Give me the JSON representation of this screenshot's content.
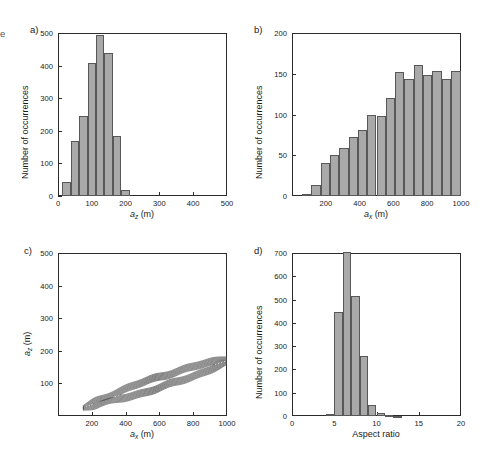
{
  "figure": {
    "edge_fragment": "e",
    "bar_fill": "#a9a9a9",
    "bar_stroke": "#585858",
    "axis_color": "#2b2b2b",
    "contour_color": "#4a4a4a"
  },
  "panels": {
    "a": {
      "letter": "a)",
      "xlabel_var": "a",
      "xlabel_sub": "z",
      "xlabel_unit": " (m)",
      "ylabel": "Number of occurrences",
      "xticks": [
        "0",
        "100",
        "200",
        "300",
        "400",
        "500"
      ],
      "yticks": [
        "0",
        "100",
        "200",
        "300",
        "400",
        "500"
      ]
    },
    "b": {
      "letter": "b)",
      "xlabel_var": "a",
      "xlabel_sub": "x",
      "xlabel_unit": " (m)",
      "ylabel": "Number of occurrences",
      "xticks": [
        "200",
        "400",
        "600",
        "800",
        "1000"
      ],
      "yticks": [
        "0",
        "50",
        "100",
        "150",
        "200"
      ]
    },
    "c": {
      "letter": "c)",
      "xlabel_var": "a",
      "xlabel_sub": "x",
      "xlabel_unit": " (m)",
      "ylabel_var": "a",
      "ylabel_sub": "z",
      "ylabel_unit": " (m)",
      "xticks": [
        "200",
        "400",
        "600",
        "800",
        "1000"
      ],
      "yticks": [
        "100",
        "200",
        "300",
        "400",
        "500"
      ]
    },
    "d": {
      "letter": "d)",
      "xlabel": "Aspect ratio",
      "ylabel": "Number of occurrences",
      "xticks": [
        "0",
        "5",
        "10",
        "15",
        "20"
      ],
      "yticks": [
        "0",
        "100",
        "200",
        "300",
        "400",
        "500",
        "600",
        "700"
      ]
    }
  },
  "chart_data": [
    {
      "type": "bar",
      "panel": "a",
      "title": "",
      "xlabel": "a_z (m)",
      "ylabel": "Number of occurrences",
      "xlim": [
        0,
        500
      ],
      "ylim": [
        0,
        500
      ],
      "xticks": [
        0,
        100,
        200,
        300,
        400,
        500
      ],
      "yticks": [
        0,
        100,
        200,
        300,
        400,
        500
      ],
      "grid": false,
      "bin_edges": [
        12.5,
        37.5,
        62.5,
        87.5,
        112.5,
        137.5,
        162.5,
        187.5,
        212.5
      ],
      "bin_centers": [
        25,
        50,
        75,
        100,
        125,
        150,
        175,
        200
      ],
      "values": [
        42,
        170,
        245,
        407,
        495,
        438,
        183,
        18
      ]
    },
    {
      "type": "bar",
      "panel": "b",
      "title": "",
      "xlabel": "a_x (m)",
      "ylabel": "Number of occurrences",
      "xlim": [
        0,
        1000
      ],
      "ylim": [
        0,
        200
      ],
      "xticks": [
        200,
        400,
        600,
        800,
        1000
      ],
      "yticks": [
        0,
        50,
        100,
        150,
        200
      ],
      "grid": false,
      "bin_edges": [
        60,
        115,
        170,
        225,
        280,
        335,
        390,
        445,
        500,
        555,
        610,
        665,
        720,
        775,
        830,
        885,
        940,
        1000
      ],
      "bin_centers": [
        87,
        142,
        197,
        252,
        307,
        362,
        417,
        472,
        527,
        582,
        637,
        692,
        747,
        802,
        857,
        912,
        970
      ],
      "values": [
        2,
        13,
        40,
        50,
        59,
        72,
        81,
        99,
        98,
        120,
        152,
        144,
        161,
        148,
        153,
        144,
        153,
        143,
        156
      ]
    },
    {
      "type": "line",
      "panel": "c",
      "title": "",
      "subtype": "contour",
      "xlabel": "a_x (m)",
      "ylabel": "a_z (m)",
      "xlim": [
        0,
        1000
      ],
      "ylim": [
        0,
        500
      ],
      "xticks": [
        200,
        400,
        600,
        800,
        1000
      ],
      "yticks": [
        100,
        200,
        300,
        400,
        500
      ],
      "grid": false,
      "description": "Nested elongated contour bands along a diagonal ridge from roughly (150,20) to (1000,180); density concentrated in a narrow band where a_z is about 0.17 of a_x",
      "n_levels": 9,
      "ridge_points": [
        [
          150,
          25
        ],
        [
          250,
          45
        ],
        [
          400,
          70
        ],
        [
          550,
          95
        ],
        [
          700,
          120
        ],
        [
          850,
          145
        ],
        [
          1000,
          170
        ]
      ]
    },
    {
      "type": "bar",
      "panel": "d",
      "title": "",
      "xlabel": "Aspect ratio",
      "ylabel": "Number of occurrences",
      "xlim": [
        0,
        20
      ],
      "ylim": [
        0,
        700
      ],
      "xticks": [
        0,
        5,
        10,
        15,
        20
      ],
      "yticks": [
        0,
        100,
        200,
        300,
        400,
        500,
        600,
        700
      ],
      "grid": false,
      "bin_edges": [
        4,
        5,
        6,
        7,
        8,
        9,
        10,
        11,
        12,
        13
      ],
      "bin_centers": [
        4.5,
        5.5,
        6.5,
        7.5,
        8.5,
        9.5,
        10.5,
        11.5,
        12.5
      ],
      "values": [
        9,
        448,
        703,
        515,
        257,
        48,
        12,
        4,
        2
      ]
    }
  ]
}
